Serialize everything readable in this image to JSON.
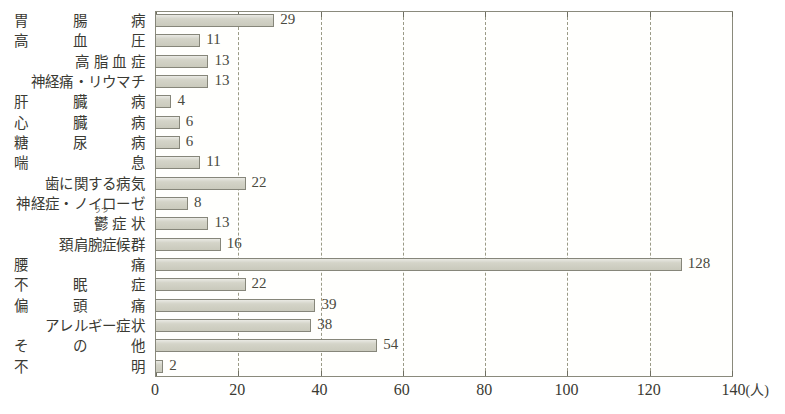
{
  "chart_data": {
    "type": "bar",
    "orientation": "horizontal",
    "title": "",
    "xlabel": "(人)",
    "ylabel": "",
    "xlim": [
      0,
      140
    ],
    "xticks": [
      0,
      20,
      40,
      60,
      80,
      100,
      120,
      140
    ],
    "xtick_labels": [
      "0",
      "20",
      "40",
      "60",
      "80",
      "100",
      "120",
      "140"
    ],
    "unit_label": "(人)",
    "grid": "vertical-dashed",
    "legend": "none",
    "categories": [
      "胃腸病",
      "高血圧",
      "高脂血症",
      "神経痛・リウマチ",
      "肝臓病",
      "心臓病",
      "糖尿病",
      "喘息",
      "歯に関する病気",
      "神経症・ノイローゼ",
      "鬱症状",
      "頚肩腕症候群",
      "腰痛",
      "不眠症",
      "偏頭痛",
      "アレルギー症状",
      "その他",
      "不明"
    ],
    "values": [
      29,
      11,
      13,
      13,
      4,
      6,
      6,
      11,
      22,
      8,
      13,
      16,
      128,
      22,
      39,
      38,
      54,
      2
    ],
    "value_labels": [
      "29",
      "11",
      "13",
      "13",
      "4",
      "6",
      "6",
      "11",
      "22",
      "8",
      "13",
      "16",
      "128",
      "22",
      "39",
      "38",
      "54",
      "2"
    ],
    "ruby": {
      "category_index": 10,
      "text": "うつ",
      "over": "鬱"
    },
    "colors": {
      "bar_fill": "#cfcfc2",
      "bar_border": "#86867a",
      "axis": "#8a8a7c",
      "grid": "#9a9a86",
      "text": "#3a3a33",
      "background": "#ffffff"
    }
  },
  "chart_labels": [
    {
      "text": "胃　腸　病",
      "style": "spaced-wide"
    },
    {
      "text": "高　血　圧",
      "style": "spaced-wide"
    },
    {
      "text": "高脂血症",
      "style": "spaced"
    },
    {
      "text": "神経痛・リウマチ",
      "style": "tight"
    },
    {
      "text": "肝　臓　病",
      "style": "spaced-wide"
    },
    {
      "text": "心　臓　病",
      "style": "spaced-wide"
    },
    {
      "text": "糖　尿　病",
      "style": "spaced-wide"
    },
    {
      "text": "喘　　　息",
      "style": "spaced-wide"
    },
    {
      "text": "歯に関する病気",
      "style": "tight"
    },
    {
      "text": "神経症・ノイローゼ",
      "style": "tight"
    },
    {
      "text": "症状",
      "style": "spaced",
      "ruby": "うつ",
      "ruby_base": "鬱"
    },
    {
      "text": "頚肩腕症候群",
      "style": "tight"
    },
    {
      "text": "腰　　　痛",
      "style": "spaced-wide"
    },
    {
      "text": "不　眠　症",
      "style": "spaced-wide"
    },
    {
      "text": "偏　頭　痛",
      "style": "spaced-wide"
    },
    {
      "text": "アレルギー症状",
      "style": "tight"
    },
    {
      "text": "そ　の　他",
      "style": "spaced-wide"
    },
    {
      "text": "不　　　明",
      "style": "spaced-wide"
    }
  ]
}
